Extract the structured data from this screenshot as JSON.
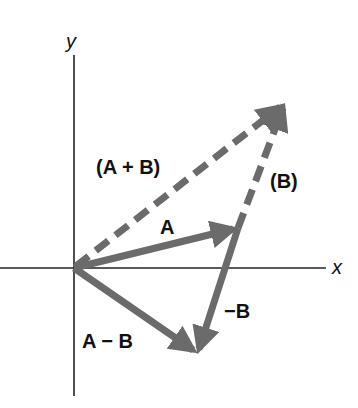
{
  "diagram": {
    "axes": {
      "x_label": "x",
      "y_label": "y"
    },
    "labels": {
      "sum": "(A + B)",
      "b_shifted": "(B)",
      "a": "A",
      "neg_b": "−B",
      "difference": "A − B"
    },
    "colors": {
      "vector": "#6b6b6b",
      "axis": "#222222",
      "text": "#111111"
    },
    "points": {
      "origin": [
        74,
        268
      ],
      "a_tip": [
        238,
        228
      ],
      "sum_tip": [
        285,
        103
      ],
      "diff_tip": [
        197,
        354
      ]
    }
  }
}
